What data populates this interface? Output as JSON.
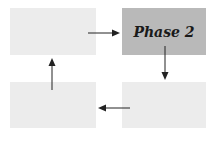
{
  "diagram": {
    "type": "cycle",
    "boxes": [
      {
        "id": "phase-1",
        "label": "",
        "x": 10,
        "y": 8,
        "w": 86,
        "h": 47,
        "fill": "#ececec"
      },
      {
        "id": "phase-2",
        "label": "Phase 2",
        "x": 122,
        "y": 8,
        "w": 84,
        "h": 47,
        "fill": "#b9b9b9",
        "highlighted": true
      },
      {
        "id": "phase-3",
        "label": "",
        "x": 122,
        "y": 82,
        "w": 84,
        "h": 46,
        "fill": "#ececec"
      },
      {
        "id": "phase-4",
        "label": "",
        "x": 10,
        "y": 82,
        "w": 86,
        "h": 46,
        "fill": "#ececec"
      }
    ],
    "arrows": [
      {
        "from": "phase-1",
        "to": "phase-2",
        "direction": "right"
      },
      {
        "from": "phase-2",
        "to": "phase-3",
        "direction": "down"
      },
      {
        "from": "phase-3",
        "to": "phase-4",
        "direction": "left"
      },
      {
        "from": "phase-4",
        "to": "phase-1",
        "direction": "up"
      }
    ],
    "arrow_color": "#222222"
  }
}
